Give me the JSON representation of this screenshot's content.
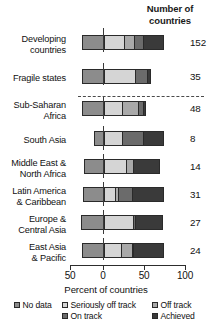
{
  "header": {
    "count_title_line1": "Number of",
    "count_title_line2": "countries"
  },
  "axis": {
    "title": "Percent of countries",
    "ticks": [
      "50",
      "0",
      "50",
      "100"
    ]
  },
  "legend": {
    "items": [
      {
        "label": "No data",
        "color": "#8c8c8c"
      },
      {
        "label": "Seriously off track",
        "color": "#d5d5d5"
      },
      {
        "label": "Off track",
        "color": "#a9a9a9"
      },
      {
        "label": "On track",
        "color": "#6b6b6b"
      },
      {
        "label": "Achieved",
        "color": "#3a3a3a"
      }
    ]
  },
  "chart_data": {
    "type": "bar",
    "subtype": "diverging-stacked-horizontal",
    "title": "",
    "xlabel": "Percent of countries",
    "ylabel": "",
    "xlim": [
      -50,
      100
    ],
    "xticks": [
      -50,
      0,
      50,
      100
    ],
    "xticklabels": [
      "50",
      "0",
      "50",
      "100"
    ],
    "grid": false,
    "legend_position": "bottom",
    "categories": [
      "Developing countries",
      "Fragile states",
      "Sub-Saharan Africa",
      "South Asia",
      "Middle East & North Africa",
      "Latin America & Caribbean",
      "Europe & Central Asia",
      "East Asia & Pacific"
    ],
    "category_lines": [
      [
        "Developing",
        "countries"
      ],
      [
        "Fragile states"
      ],
      [
        "Sub-Saharan",
        "Africa"
      ],
      [
        "South Asia"
      ],
      [
        "Middle East &",
        "North Africa"
      ],
      [
        "Latin America",
        "& Caribbean"
      ],
      [
        "Europe &",
        "Central Asia"
      ],
      [
        "East Asia",
        "& Pacific"
      ]
    ],
    "counts": [
      "152",
      "35",
      "48",
      "8",
      "14",
      "31",
      "27",
      "24"
    ],
    "series": [
      {
        "name": "No data",
        "color": "#8c8c8c",
        "values": [
          -26,
          -26,
          -26,
          -11,
          -23,
          -24,
          -27,
          -26
        ]
      },
      {
        "name": "Seriously off track",
        "color": "#d5d5d5",
        "values": [
          24,
          38,
          22,
          22,
          27,
          13,
          35,
          21
        ]
      },
      {
        "name": "Off track",
        "color": "#a9a9a9",
        "values": [
          13,
          0,
          19,
          0,
          8,
          4,
          0,
          13
        ]
      },
      {
        "name": "On track",
        "color": "#6b6b6b",
        "values": [
          10,
          14,
          7,
          26,
          0,
          17,
          3,
          2
        ]
      },
      {
        "name": "Achieved",
        "color": "#3a3a3a",
        "values": [
          27,
          6,
          5,
          26,
          35,
          40,
          35,
          38
        ]
      }
    ],
    "annotations": [
      {
        "type": "separator",
        "after_category": "Fragile states",
        "style": "dashed"
      },
      {
        "type": "zero-line",
        "x": 0
      }
    ]
  },
  "layout": {
    "rows": [
      {
        "top": 4,
        "label_top": 4,
        "bar_top": 5,
        "zero_top": -2,
        "zero_h": 24
      },
      {
        "top": 38,
        "label_top": 43,
        "bar_top": 39,
        "zero_top": 33,
        "zero_h": 22
      },
      {
        "top": 70,
        "label_top": 70,
        "bar_top": 71,
        "zero_top": 67,
        "zero_h": 22
      },
      {
        "top": 100,
        "label_top": 105,
        "bar_top": 101,
        "zero_top": 96,
        "zero_h": 24
      },
      {
        "top": 128,
        "label_top": 128,
        "bar_top": 129,
        "zero_top": 124,
        "zero_h": 24
      },
      {
        "top": 156,
        "label_top": 156,
        "bar_top": 157,
        "zero_top": 152,
        "zero_h": 24
      },
      {
        "top": 184,
        "label_top": 184,
        "bar_top": 185,
        "zero_top": 180,
        "zero_h": 24
      },
      {
        "top": 212,
        "label_top": 212,
        "bar_top": 213,
        "zero_top": 208,
        "zero_h": 22
      }
    ],
    "x0": 103,
    "px_per_unit": 0.82,
    "dash_top": 66,
    "dash_left": 78,
    "dash_width": 126,
    "ticks_px": [
      70,
      103,
      144,
      185
    ],
    "legend_rows": [
      {
        "left": 14,
        "top": 2,
        "idx": 0
      },
      {
        "left": 62,
        "top": 2,
        "idx": 1
      },
      {
        "left": 152,
        "top": 2,
        "idx": 2
      },
      {
        "left": 62,
        "top": 13,
        "idx": 3
      },
      {
        "left": 152,
        "top": 13,
        "idx": 4
      }
    ]
  }
}
